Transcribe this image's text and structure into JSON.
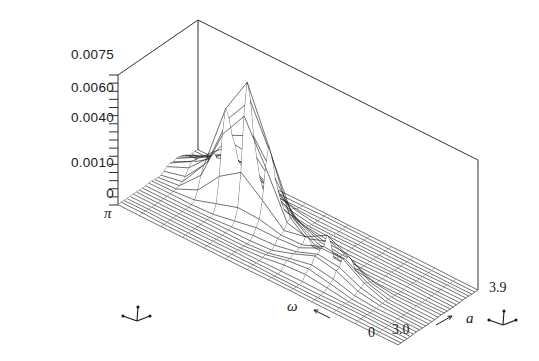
{
  "figure": {
    "kind": "3d-surface-wireframe",
    "background_color": "#ffffff",
    "line_color": "#1a1a1a"
  },
  "y_axis": {
    "ticks": [
      "0.0075",
      "0.0060",
      "0.0040",
      "0.0010",
      "0"
    ],
    "tick_values": [
      0.0075,
      0.006,
      0.004,
      0.001,
      0
    ],
    "minor_tick_count": 16
  },
  "x_axis": {
    "label": "ω",
    "start_label": "π",
    "end_label": "0",
    "arrow": "arrow-left"
  },
  "z_axis": {
    "label": "a",
    "start_label": "3.0",
    "end_label": "3.9",
    "arrow": "arrow-right"
  },
  "glyphs": {
    "left_triad": "axis-triad-icon",
    "right_triad": "axis-triad-icon"
  },
  "chart_data": {
    "type": "surface",
    "title": "",
    "xlabel": "ω",
    "ylabel": "",
    "zlabel": "a",
    "xlim": [
      0,
      3.14159
    ],
    "zlim": [
      3.0,
      3.9
    ],
    "ylim": [
      0,
      0.0075
    ],
    "x_tick_labels": [
      "π",
      "0"
    ],
    "z_tick_labels": [
      "3.0",
      "3.9"
    ],
    "y_tick_labels": [
      "0",
      "0.0010",
      "0.0040",
      "0.0060",
      "0.0075"
    ],
    "grid_nx": 26,
    "grid_nz": 13,
    "grid": true,
    "legend": "none",
    "peaks": [
      {
        "name": "main-peak",
        "x": 0.46,
        "z": 0.3,
        "height": 0.0078,
        "sx": 0.055,
        "sz": 0.085
      },
      {
        "name": "shoulder-ridge",
        "x": 0.345,
        "z": 0.24,
        "height": 0.0026,
        "sx": 0.045,
        "sz": 0.12
      },
      {
        "name": "left-bump-a",
        "x": 0.175,
        "z": 0.19,
        "height": 0.00175,
        "sx": 0.035,
        "sz": 0.1
      },
      {
        "name": "left-bump-b",
        "x": 0.255,
        "z": 0.18,
        "height": 0.00145,
        "sx": 0.03,
        "sz": 0.1
      },
      {
        "name": "front-peak-a",
        "x": 0.525,
        "z": 0.62,
        "height": 0.0018,
        "sx": 0.03,
        "sz": 0.075
      },
      {
        "name": "front-peak-b",
        "x": 0.605,
        "z": 0.66,
        "height": 0.00135,
        "sx": 0.032,
        "sz": 0.075
      },
      {
        "name": "front-peak-c",
        "x": 0.685,
        "z": 0.63,
        "height": 0.00105,
        "sx": 0.034,
        "sz": 0.08
      },
      {
        "name": "ripple-d",
        "x": 0.775,
        "z": 0.6,
        "height": 0.00045,
        "sx": 0.038,
        "sz": 0.09
      },
      {
        "name": "ripple-e",
        "x": 0.6,
        "z": 0.42,
        "height": 0.00055,
        "sx": 0.04,
        "sz": 0.09
      }
    ]
  }
}
